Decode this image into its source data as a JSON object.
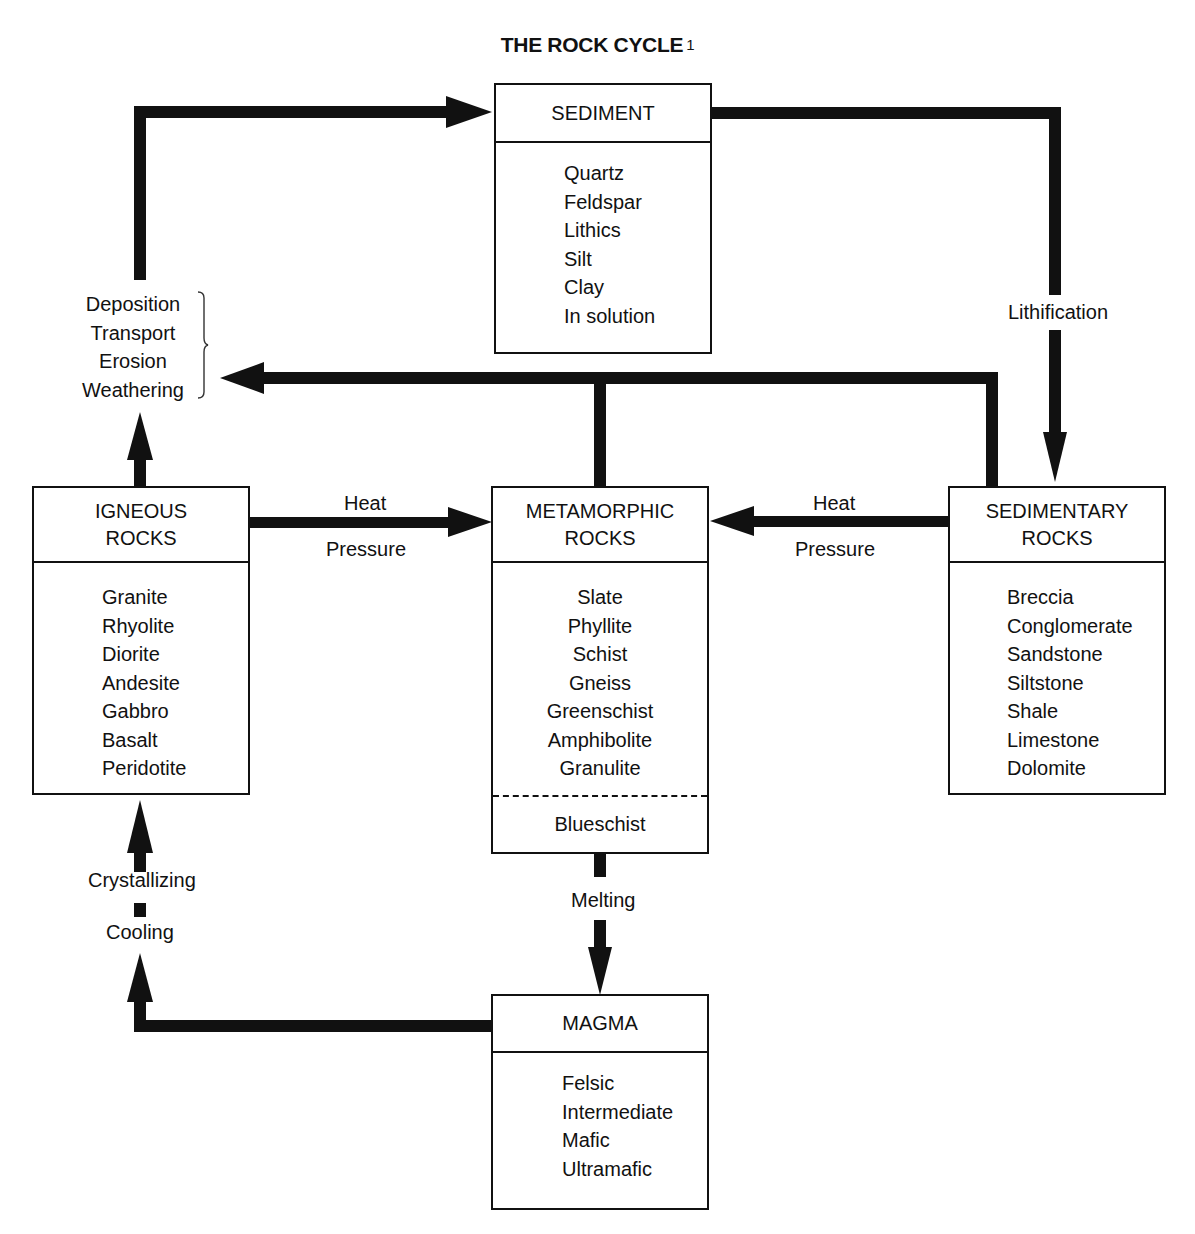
{
  "title": {
    "text": "THE ROCK CYCLE",
    "footnote": "1"
  },
  "boxes": {
    "sediment": {
      "heading": "SEDIMENT",
      "items": [
        "Quartz",
        "Feldspar",
        "Lithics",
        "Silt",
        "Clay",
        "In solution"
      ]
    },
    "igneous": {
      "heading_line1": "IGNEOUS",
      "heading_line2": "ROCKS",
      "items": [
        "Granite",
        "Rhyolite",
        "Diorite",
        "Andesite",
        "Gabbro",
        "Basalt",
        "Peridotite"
      ]
    },
    "metamorphic": {
      "heading_line1": "METAMORPHIC",
      "heading_line2": "ROCKS",
      "items": [
        "Slate",
        "Phyllite",
        "Schist",
        "Gneiss",
        "Greenschist",
        "Amphibolite",
        "Granulite"
      ],
      "separated_item": "Blueschist"
    },
    "sedimentary": {
      "heading_line1": "SEDIMENTARY",
      "heading_line2": "ROCKS",
      "items": [
        "Breccia",
        "Conglomerate",
        "Sandstone",
        "Siltstone",
        "Shale",
        "Limestone",
        "Dolomite"
      ]
    },
    "magma": {
      "heading": "MAGMA",
      "items": [
        "Felsic",
        "Intermediate",
        "Mafic",
        "Ultramafic"
      ]
    }
  },
  "processes": {
    "surface": [
      "Deposition",
      "Transport",
      "Erosion",
      "Weathering"
    ],
    "lithification": "Lithification",
    "igneous_to_meta": {
      "top": "Heat",
      "bottom": "Pressure"
    },
    "sed_to_meta": {
      "top": "Heat",
      "bottom": "Pressure"
    },
    "melting": "Melting",
    "crystallizing": "Crystallizing",
    "cooling": "Cooling"
  }
}
